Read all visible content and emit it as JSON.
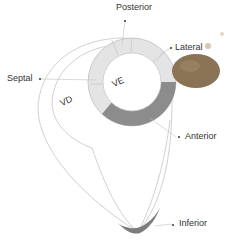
{
  "diagram": {
    "type": "heart-left-ventricle-cross-section",
    "labels": {
      "posterior": "Posterior",
      "lateral": "Lateral",
      "septal": "Septal",
      "anterior": "Anterior",
      "inferior": "Inferior",
      "ve": "VE",
      "vd": "VD"
    },
    "colors": {
      "outline": "#bbbbbb",
      "ring_light": "#e6e6e6",
      "ring_dark": "#8a8a8a",
      "apex_dark": "#7a7a7a",
      "label_text": "#333333",
      "blob": "#8b7355"
    }
  }
}
